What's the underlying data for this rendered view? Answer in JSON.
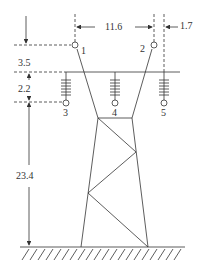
{
  "figure": {
    "type": "transmission-tower-geometry",
    "colors": {
      "line": "#333333",
      "background": "#ffffff"
    }
  },
  "conductors": [
    {
      "id": "1",
      "label": "1"
    },
    {
      "id": "2",
      "label": "2"
    },
    {
      "id": "3",
      "label": "3"
    },
    {
      "id": "4",
      "label": "4"
    },
    {
      "id": "5",
      "label": "5"
    }
  ],
  "dimensions": {
    "horizontal_spacing_top": "11.6",
    "offset_right": "1.7",
    "top_to_crossarm": "3.5",
    "insulator_length": "2.2",
    "height_to_ground": "23.4"
  }
}
